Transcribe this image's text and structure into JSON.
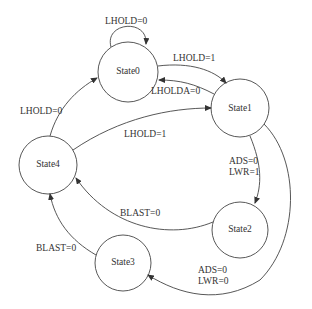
{
  "diagram": {
    "type": "state-machine",
    "colors": {
      "stroke": "#444444",
      "text": "#333333",
      "background": "#ffffff"
    },
    "states": [
      {
        "id": "s0",
        "label": "State0"
      },
      {
        "id": "s1",
        "label": "State1"
      },
      {
        "id": "s2",
        "label": "State2"
      },
      {
        "id": "s3",
        "label": "State3"
      },
      {
        "id": "s4",
        "label": "State4"
      }
    ],
    "transitions": [
      {
        "from": "State0",
        "to": "State0",
        "label": "LHOLD=0"
      },
      {
        "from": "State0",
        "to": "State1",
        "label": "LHOLD=1"
      },
      {
        "from": "State1",
        "to": "State0",
        "label": "LHOLDA=0"
      },
      {
        "from": "State4",
        "to": "State1",
        "label": "LHOLD=1"
      },
      {
        "from": "State4",
        "to": "State0",
        "label": "LHOLD=0"
      },
      {
        "from": "State1",
        "to": "State2",
        "label_lines": [
          "ADS=0",
          "LWR=1"
        ]
      },
      {
        "from": "State2",
        "to": "State4",
        "label": "BLAST=0"
      },
      {
        "from": "State1",
        "to": "State3",
        "label_lines": [
          "ADS=0",
          "LWR=0"
        ]
      },
      {
        "from": "State3",
        "to": "State4",
        "label": "BLAST=0"
      }
    ]
  }
}
